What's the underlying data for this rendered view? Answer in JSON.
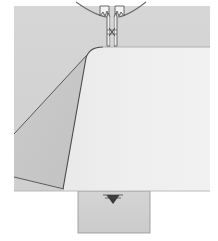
{
  "figure": {
    "type": "technical-cross-section-diagram",
    "title": "",
    "caption": "",
    "canvas": {
      "width": 218,
      "height": 241
    },
    "background_color": "#ffffff"
  },
  "colors": {
    "page_background": "#ffffff",
    "body_gray": "#d2d2d2",
    "wedge_gray": "#c8c8c8",
    "core_light": "#eeeeee",
    "core_light_edge": "#e6e6e6",
    "tab_gray": "#cfcfcf",
    "outline_dark": "#4a4a4a",
    "outline_mid": "#7a7a7a",
    "fixture_light": "#f2f2f2",
    "fixture_shadow": "#9a9a9a",
    "marker_dark": "#3a3a3a"
  },
  "regions": [
    {
      "name": "outer-body-block",
      "label": "",
      "fill": "#d2d2d2",
      "bounds": {
        "x": 14,
        "y": 6,
        "width": 196,
        "height": 185
      }
    },
    {
      "name": "left-wedge",
      "label": "",
      "fill": "#c8c8c8",
      "note": "darker triangular wedge bounded by two diagonals"
    },
    {
      "name": "core-light-region",
      "label": "",
      "fill": "#eeeeee",
      "note": "light near-white region with rounded shoulder at upper left"
    },
    {
      "name": "bottom-tab",
      "label": "",
      "fill": "#cfcfcf",
      "bounds": {
        "x": 78,
        "y": 191,
        "width": 72,
        "height": 42
      }
    }
  ],
  "details": [
    {
      "name": "top-fixture-clamp",
      "label": "",
      "position": {
        "x": 110,
        "y": 24
      },
      "description": "symmetric clamp fixture with two jaws and vertical stem"
    },
    {
      "name": "top-arc",
      "label": "",
      "description": "shallow arc sweeping down from both sides to the fixture"
    },
    {
      "name": "bottom-marker",
      "label": "",
      "position": {
        "x": 113,
        "y": 196
      },
      "description": "small dark chevron / arrow marking on the tab"
    }
  ],
  "annotations": {
    "labels": [],
    "dimensions": [],
    "leader_lines": []
  }
}
